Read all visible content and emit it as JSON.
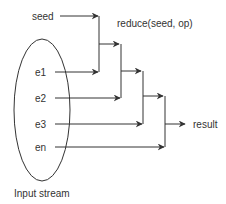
{
  "diagram": {
    "type": "reduce-flow",
    "title_label": "reduce(seed, op)",
    "seed_label": "seed",
    "inputs": [
      {
        "label": "e1"
      },
      {
        "label": "e2"
      },
      {
        "label": "e3"
      },
      {
        "label": "en"
      }
    ],
    "result_label": "result",
    "stream_label": "Input stream",
    "colors": {
      "line": "#333333",
      "text": "#333333",
      "background": "#ffffff"
    }
  }
}
